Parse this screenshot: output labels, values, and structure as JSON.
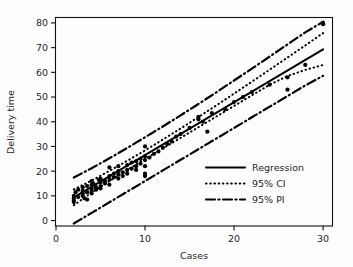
{
  "chart_data": {
    "type": "scatter",
    "title": "",
    "xlabel": "Cases",
    "ylabel": "Delivery time",
    "xlim": [
      0,
      31
    ],
    "ylim": [
      -2,
      82
    ],
    "xticks": [
      0,
      10,
      20,
      30
    ],
    "yticks": [
      0,
      10,
      20,
      30,
      40,
      50,
      60,
      70,
      80
    ],
    "xtick_labels": [
      "0",
      "10",
      "20",
      "30"
    ],
    "ytick_labels": [
      "0",
      "10",
      "20",
      "30",
      "40",
      "50",
      "60",
      "70",
      "80"
    ],
    "grid": false,
    "legend_position": "lower-right",
    "legend": [
      {
        "label": "Regression",
        "style": "solid"
      },
      {
        "label": "95% CI",
        "style": "dotted"
      },
      {
        "label": "95% PI",
        "style": "dashdot"
      }
    ],
    "fit": {
      "intercept": 5.1,
      "slope": 2.14,
      "x_start": 2.0,
      "x_end": 30.0,
      "y_start": 9.4,
      "y_end": 69.3
    },
    "ci_upper": {
      "x": [
        2.0,
        4.0,
        6.0,
        8.0,
        10.0,
        12.0,
        14.0,
        16.0,
        18.0,
        20.0,
        22.0,
        24.0,
        26.0,
        28.0,
        30.0
      ],
      "y": [
        12.6,
        16.2,
        20.1,
        24.2,
        28.4,
        32.8,
        37.3,
        41.9,
        46.6,
        51.4,
        56.2,
        61.1,
        66.0,
        70.9,
        75.9
      ]
    },
    "ci_lower": {
      "x": [
        2.0,
        4.0,
        6.0,
        8.0,
        10.0,
        12.0,
        14.0,
        16.0,
        18.0,
        20.0,
        22.0,
        24.0,
        26.0,
        28.0,
        30.0
      ],
      "y": [
        6.2,
        11.3,
        16.0,
        20.5,
        24.9,
        29.2,
        33.5,
        37.8,
        42.1,
        46.4,
        50.7,
        55.0,
        58.5,
        61.0,
        63.0
      ]
    },
    "pi_upper": {
      "x": [
        2.0,
        4.0,
        6.0,
        8.0,
        10.0,
        12.0,
        14.0,
        16.0,
        18.0,
        20.0,
        22.0,
        24.0,
        26.0,
        28.0,
        30.0
      ],
      "y": [
        17.4,
        21.2,
        25.2,
        29.4,
        33.7,
        38.1,
        42.6,
        47.2,
        51.9,
        56.7,
        61.5,
        66.4,
        71.3,
        76.2,
        80.5
      ]
    },
    "pi_lower": {
      "x": [
        2.0,
        4.0,
        6.0,
        8.0,
        10.0,
        12.0,
        14.0,
        16.0,
        18.0,
        20.0,
        22.0,
        24.0,
        26.0,
        28.0,
        30.0
      ],
      "y": [
        -1.2,
        3.1,
        7.4,
        11.7,
        16.0,
        20.3,
        24.6,
        28.9,
        33.2,
        37.5,
        41.8,
        46.1,
        50.4,
        54.7,
        58.6
      ]
    },
    "points": [
      {
        "x": 2.0,
        "y": 8.0
      },
      {
        "x": 2.0,
        "y": 9.0
      },
      {
        "x": 2.0,
        "y": 10.0
      },
      {
        "x": 2.0,
        "y": 7.5
      },
      {
        "x": 2.2,
        "y": 11.5
      },
      {
        "x": 2.5,
        "y": 9.5
      },
      {
        "x": 2.5,
        "y": 12.5
      },
      {
        "x": 3.0,
        "y": 10.0
      },
      {
        "x": 3.0,
        "y": 11.0
      },
      {
        "x": 3.0,
        "y": 12.0
      },
      {
        "x": 3.0,
        "y": 13.5
      },
      {
        "x": 3.2,
        "y": 9.0
      },
      {
        "x": 3.5,
        "y": 11.5
      },
      {
        "x": 3.5,
        "y": 14.0
      },
      {
        "x": 3.5,
        "y": 8.5
      },
      {
        "x": 4.0,
        "y": 12.0
      },
      {
        "x": 4.0,
        "y": 13.0
      },
      {
        "x": 4.0,
        "y": 14.5
      },
      {
        "x": 4.0,
        "y": 16.0
      },
      {
        "x": 4.0,
        "y": 11.0
      },
      {
        "x": 4.2,
        "y": 15.0
      },
      {
        "x": 4.5,
        "y": 13.5
      },
      {
        "x": 4.5,
        "y": 12.5
      },
      {
        "x": 4.8,
        "y": 16.5
      },
      {
        "x": 5.0,
        "y": 14.0
      },
      {
        "x": 5.0,
        "y": 15.5
      },
      {
        "x": 5.0,
        "y": 13.0
      },
      {
        "x": 5.0,
        "y": 17.0
      },
      {
        "x": 5.5,
        "y": 15.0
      },
      {
        "x": 5.5,
        "y": 16.0
      },
      {
        "x": 6.0,
        "y": 16.5
      },
      {
        "x": 6.0,
        "y": 18.0
      },
      {
        "x": 6.0,
        "y": 14.5
      },
      {
        "x": 6.0,
        "y": 21.5
      },
      {
        "x": 6.5,
        "y": 17.5
      },
      {
        "x": 6.5,
        "y": 19.0
      },
      {
        "x": 7.0,
        "y": 18.5
      },
      {
        "x": 7.0,
        "y": 17.0
      },
      {
        "x": 7.0,
        "y": 20.0
      },
      {
        "x": 7.0,
        "y": 22.0
      },
      {
        "x": 7.5,
        "y": 19.5
      },
      {
        "x": 7.5,
        "y": 18.0
      },
      {
        "x": 8.0,
        "y": 20.5
      },
      {
        "x": 8.0,
        "y": 19.0
      },
      {
        "x": 8.0,
        "y": 22.5
      },
      {
        "x": 8.5,
        "y": 21.0
      },
      {
        "x": 8.5,
        "y": 23.5
      },
      {
        "x": 9.0,
        "y": 22.0
      },
      {
        "x": 9.0,
        "y": 24.0
      },
      {
        "x": 9.0,
        "y": 20.5
      },
      {
        "x": 9.5,
        "y": 25.0
      },
      {
        "x": 9.5,
        "y": 23.0
      },
      {
        "x": 10.0,
        "y": 24.5
      },
      {
        "x": 10.0,
        "y": 26.0
      },
      {
        "x": 10.0,
        "y": 22.0
      },
      {
        "x": 10.0,
        "y": 19.0
      },
      {
        "x": 10.0,
        "y": 18.0
      },
      {
        "x": 10.0,
        "y": 30.0
      },
      {
        "x": 10.5,
        "y": 25.5
      },
      {
        "x": 11.0,
        "y": 27.0
      },
      {
        "x": 11.5,
        "y": 28.0
      },
      {
        "x": 12.0,
        "y": 29.5
      },
      {
        "x": 12.5,
        "y": 31.0
      },
      {
        "x": 13.0,
        "y": 32.0
      },
      {
        "x": 13.5,
        "y": 34.0
      },
      {
        "x": 14.0,
        "y": 35.0
      },
      {
        "x": 15.0,
        "y": 37.5
      },
      {
        "x": 16.0,
        "y": 41.0
      },
      {
        "x": 16.0,
        "y": 42.0
      },
      {
        "x": 16.5,
        "y": 40.0
      },
      {
        "x": 17.0,
        "y": 36.0
      },
      {
        "x": 17.5,
        "y": 43.5
      },
      {
        "x": 19.0,
        "y": 45.0
      },
      {
        "x": 20.0,
        "y": 48.0
      },
      {
        "x": 21.0,
        "y": 50.0
      },
      {
        "x": 22.0,
        "y": 52.0
      },
      {
        "x": 24.0,
        "y": 55.0
      },
      {
        "x": 26.0,
        "y": 53.0
      },
      {
        "x": 26.0,
        "y": 58.0
      },
      {
        "x": 28.0,
        "y": 63.0
      },
      {
        "x": 30.0,
        "y": 79.5
      },
      {
        "x": 30.0,
        "y": 80.0
      }
    ]
  },
  "axes": {
    "x_title": "Cases",
    "y_title": "Delivery time"
  },
  "legend": {
    "regression_label": "Regression",
    "ci_label": "95% CI",
    "pi_label": "95% PI"
  },
  "colors": {
    "ink": "#000000",
    "background": "#fdfdfd"
  }
}
